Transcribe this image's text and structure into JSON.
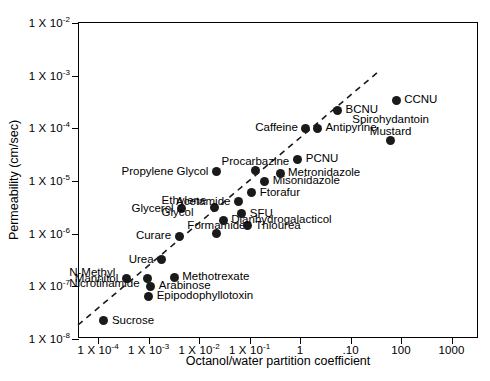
{
  "chart_data": {
    "type": "scatter",
    "title": "",
    "xlabel": "Octanol/water partition coefficient",
    "ylabel": "Permeability (cm/sec)",
    "xscale": "log",
    "yscale": "log",
    "grid": false,
    "legend": "none",
    "xticklabels": [
      {
        "text": "1 X 10",
        "exp": "-4"
      },
      {
        "text": "1 X 10",
        "exp": "-3"
      },
      {
        "text": "1 X 10",
        "exp": "-2"
      },
      {
        "text": "1 X 10",
        "exp": "-1"
      },
      {
        "text": "1",
        "exp": ""
      },
      {
        "text": ".10",
        "exp": ""
      },
      {
        "text": "100",
        "exp": ""
      },
      {
        "text": "1000",
        "exp": ""
      }
    ],
    "yticklabels": [
      {
        "text": "1 X 10",
        "exp": "-2"
      },
      {
        "text": "1 X 10",
        "exp": "-3"
      },
      {
        "text": "1 X 10",
        "exp": "-4"
      },
      {
        "text": "1 X 10",
        "exp": "-5"
      },
      {
        "text": "1 X 10",
        "exp": "-6"
      },
      {
        "text": "1 X 10",
        "exp": "-7"
      },
      {
        "text": "1 X 10",
        "exp": "-8"
      }
    ],
    "ylim": [
      1e-08,
      0.01
    ],
    "marker_color": "#1a1a1a",
    "trendline": {
      "style": "dashed",
      "color": "#1a1a1a"
    },
    "points": [
      {
        "label": "Sucrose",
        "x": 0.00013,
        "y": 2.2e-08,
        "side": "r"
      },
      {
        "label": "Mannitol",
        "x": 0.00036,
        "y": 1.4e-07,
        "side": "l"
      },
      {
        "label": "Epipodophyllotoxin",
        "x": 0.001,
        "y": 6.5e-08,
        "side": "r"
      },
      {
        "label": "Arabinose",
        "x": 0.0011,
        "y": 1e-07,
        "side": "r"
      },
      {
        "label": "N-Methyl\nNicrotinamide",
        "x": 0.00095,
        "y": 1.4e-07,
        "side": "l"
      },
      {
        "label": "Methotrexate",
        "x": 0.0032,
        "y": 1.5e-07,
        "side": "r"
      },
      {
        "label": "Urea",
        "x": 0.0018,
        "y": 3.2e-07,
        "side": "l"
      },
      {
        "label": "Formamide",
        "x": 0.022,
        "y": 1e-06,
        "side": "c"
      },
      {
        "label": "Curare",
        "x": 0.004,
        "y": 9e-07,
        "side": "l"
      },
      {
        "label": "Thiourea",
        "x": 0.09,
        "y": 1.4e-06,
        "side": "r"
      },
      {
        "label": "Dianhydrogalacticol",
        "x": 0.03,
        "y": 1.8e-06,
        "side": "r"
      },
      {
        "label": "SFU",
        "x": 0.07,
        "y": 2.4e-06,
        "side": "r"
      },
      {
        "label": "Glycerol",
        "x": 0.0045,
        "y": 3e-06,
        "side": "l"
      },
      {
        "label": "Ethylene\nGlycol",
        "x": 0.02,
        "y": 3.2e-06,
        "side": "l"
      },
      {
        "label": "Acetamide",
        "x": 0.06,
        "y": 4e-06,
        "side": "l"
      },
      {
        "label": "Ftorafur",
        "x": 0.11,
        "y": 6e-06,
        "side": "r"
      },
      {
        "label": "Misonidazole",
        "x": 0.2,
        "y": 1e-05,
        "side": "r"
      },
      {
        "label": "Propylene Glycol",
        "x": 0.022,
        "y": 1.5e-05,
        "side": "l"
      },
      {
        "label": "Metronidazole",
        "x": 0.4,
        "y": 1.4e-05,
        "side": "r"
      },
      {
        "label": "Procarbazine",
        "x": 0.13,
        "y": 1.6e-05,
        "side": "c"
      },
      {
        "label": "PCNU",
        "x": 0.9,
        "y": 2.6e-05,
        "side": "r"
      },
      {
        "label": "Caffeine",
        "x": 1.3,
        "y": 0.0001,
        "side": "l"
      },
      {
        "label": "Antipyrine",
        "x": 2.2,
        "y": 0.0001,
        "side": "r"
      },
      {
        "label": "BCNU",
        "x": 5.5,
        "y": 0.00022,
        "side": "r"
      },
      {
        "label": "CCNU",
        "x": 80.0,
        "y": 0.00034,
        "side": "r"
      },
      {
        "label": "Spirohydantoin\nMustard",
        "x": 62.0,
        "y": 6e-05,
        "side": "c"
      }
    ]
  }
}
